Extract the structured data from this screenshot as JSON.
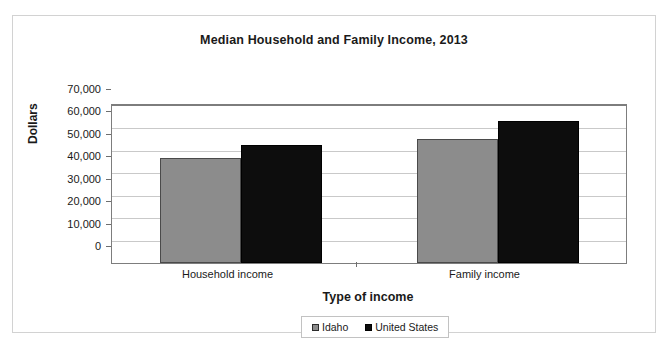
{
  "chart_data": {
    "type": "bar",
    "title": "Median Household and Family Income, 2013",
    "xlabel": "Type of income",
    "ylabel": "Dollars",
    "categories": [
      "Household income",
      "Family income"
    ],
    "series": [
      {
        "name": "Idaho",
        "color": "#8c8c8c",
        "values": [
          46800,
          55300
        ]
      },
      {
        "name": "United States",
        "color": "#0d0d0d",
        "values": [
          52400,
          63500
        ]
      }
    ],
    "ylim": [
      0,
      70000
    ],
    "ytick_step": 10000,
    "ytick_labels": [
      "70,000",
      "60,000",
      "50,000",
      "40,000",
      "30,000",
      "20,000",
      "10,000",
      "0"
    ],
    "grid": true,
    "legend_position": "bottom"
  }
}
